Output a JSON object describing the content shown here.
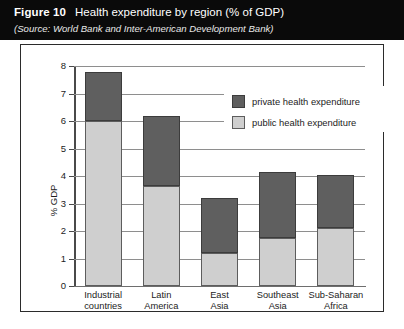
{
  "header": {
    "figure_number": "Figure 10",
    "title": "Health expenditure by region (% of GDP)",
    "source": "(Source: World Bank and Inter-American Development Bank)"
  },
  "legend": {
    "items": [
      {
        "label": "private health expenditure",
        "color": "#5f5f5f",
        "key": "private"
      },
      {
        "label": "public health expenditure",
        "color": "#cfcfcf",
        "key": "public"
      }
    ]
  },
  "axes": {
    "ylabel": "% GDP",
    "yticks": [
      "0",
      "1",
      "2",
      "3",
      "4",
      "5",
      "6",
      "7",
      "8"
    ]
  },
  "chart_data": {
    "type": "bar",
    "subtype": "stacked",
    "title": "Health expenditure by region (% of GDP)",
    "subtitle": "(Source: World Bank and Inter-American Development Bank)",
    "xlabel": "",
    "ylabel": "% GDP",
    "ylim": [
      0,
      8
    ],
    "ytick_step": 1,
    "grid": true,
    "legend_position": "inside-top-right",
    "categories": [
      "Industrial countries",
      "Latin America",
      "East Asia",
      "Southeast Asia",
      "Sub-Saharan Africa"
    ],
    "category_lines": [
      [
        "Industrial",
        "countries"
      ],
      [
        "Latin",
        "America"
      ],
      [
        "East",
        "Asia"
      ],
      [
        "Southeast",
        "Asia"
      ],
      [
        "Sub-Saharan",
        "Africa"
      ]
    ],
    "series": [
      {
        "name": "public health expenditure",
        "color": "#cfcfcf",
        "values": [
          6.0,
          3.65,
          1.2,
          1.75,
          2.1
        ]
      },
      {
        "name": "private health expenditure",
        "color": "#5f5f5f",
        "values": [
          1.8,
          2.55,
          2.0,
          2.4,
          1.95
        ]
      }
    ],
    "totals": [
      7.8,
      6.2,
      3.2,
      4.15,
      4.05
    ]
  }
}
